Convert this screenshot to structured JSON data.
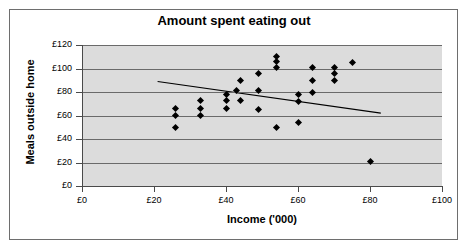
{
  "figure": {
    "width": 468,
    "height": 250,
    "background_color": "#ffffff",
    "frame_color": "#6e6e6e",
    "plot_background_color": "#dcdcdc",
    "gridline_color": "#6a6a6a",
    "marker_color": "#000000",
    "trendline_color": "#000000"
  },
  "chart_data": {
    "type": "scatter",
    "title": "Amount spent eating out",
    "xlabel": "Income ('000)",
    "ylabel": "Meals outside home",
    "xlim": [
      0,
      100
    ],
    "ylim": [
      0,
      120
    ],
    "xticks": [
      0,
      20,
      40,
      60,
      80,
      100
    ],
    "yticks": [
      0,
      20,
      40,
      60,
      80,
      100,
      120
    ],
    "xtick_labels": [
      "£0",
      "£20",
      "£40",
      "£60",
      "£80",
      "£100"
    ],
    "ytick_labels": [
      "£0",
      "£20",
      "£40",
      "£60",
      "£80",
      "£100",
      "£120"
    ],
    "grid": true,
    "grid_axis": "y",
    "legend": false,
    "currency_symbol": "£",
    "points": [
      {
        "x": 26,
        "y": 66
      },
      {
        "x": 26,
        "y": 60
      },
      {
        "x": 26,
        "y": 50
      },
      {
        "x": 33,
        "y": 73
      },
      {
        "x": 33,
        "y": 66
      },
      {
        "x": 33,
        "y": 60
      },
      {
        "x": 40,
        "y": 78
      },
      {
        "x": 40,
        "y": 73
      },
      {
        "x": 40,
        "y": 66
      },
      {
        "x": 43,
        "y": 81
      },
      {
        "x": 44,
        "y": 90
      },
      {
        "x": 44,
        "y": 73
      },
      {
        "x": 49,
        "y": 96
      },
      {
        "x": 49,
        "y": 81
      },
      {
        "x": 49,
        "y": 65
      },
      {
        "x": 54,
        "y": 110
      },
      {
        "x": 54,
        "y": 106
      },
      {
        "x": 54,
        "y": 101
      },
      {
        "x": 54,
        "y": 50
      },
      {
        "x": 60,
        "y": 78
      },
      {
        "x": 60,
        "y": 72
      },
      {
        "x": 60,
        "y": 54
      },
      {
        "x": 64,
        "y": 101
      },
      {
        "x": 64,
        "y": 90
      },
      {
        "x": 64,
        "y": 80
      },
      {
        "x": 70,
        "y": 101
      },
      {
        "x": 70,
        "y": 96
      },
      {
        "x": 70,
        "y": 90
      },
      {
        "x": 75,
        "y": 105
      },
      {
        "x": 80,
        "y": 21
      }
    ],
    "trendline": {
      "visible": true,
      "x_start": 21,
      "y_start": 89,
      "x_end": 83,
      "y_end": 62
    }
  }
}
